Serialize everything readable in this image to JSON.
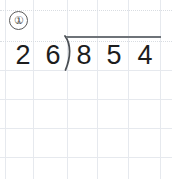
{
  "worksheet": {
    "problem_number": "①",
    "background_color": "#ffffff",
    "grid_color": "#d9dde2",
    "ink_color": "#1d1d1d",
    "rule_color": "#6e7378"
  },
  "grid": {
    "vertical_x": [
      5,
      33,
      67,
      97,
      128,
      160
    ],
    "horizontal_y": [
      10,
      41,
      70,
      99,
      128,
      157
    ]
  },
  "problem": {
    "type": "long-division",
    "divisor": "26",
    "dividend": "854",
    "divisor_digits": [
      "2",
      "6"
    ],
    "dividend_digits": [
      "8",
      "5",
      "4"
    ],
    "quotient_digits": [],
    "bracket_glyph": ")"
  }
}
